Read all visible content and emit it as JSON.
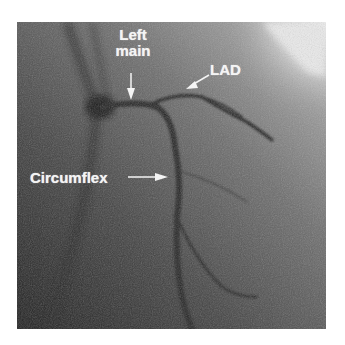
{
  "figure": {
    "labels": {
      "left_main_line1": "Left",
      "left_main_line2": "main",
      "lad": "LAD",
      "circumflex": "Circumflex"
    },
    "colors": {
      "background": "#ffffff",
      "image_dark": "#2a2a2a",
      "image_mid": "#5a5a5a",
      "image_light": "#e8e8e8",
      "label_text": "#f4f4f4",
      "vessel": "#262626"
    }
  }
}
